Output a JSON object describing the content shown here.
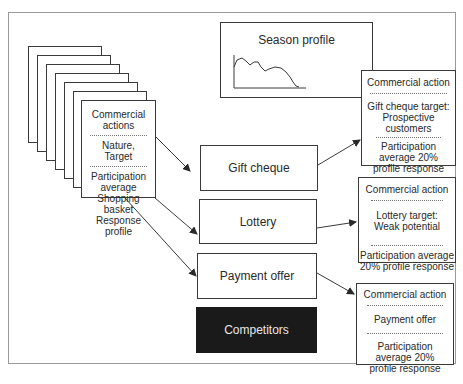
{
  "diagram": {
    "source_card": {
      "title": "Commercial actions",
      "section2": "Nature, Target",
      "section3_line1": "Participation",
      "section3_line2": "average",
      "section3_line3": "Shopping basket",
      "section3_line4": "Response profile",
      "stack_count": 7
    },
    "season_profile": {
      "title": "Season profile"
    },
    "actions": [
      {
        "label": "Gift cheque"
      },
      {
        "label": "Lottery"
      },
      {
        "label": "Payment offer"
      },
      {
        "label": "Competitors"
      }
    ],
    "result_cards": [
      {
        "header": "Commercial action",
        "target_line1": "Gift cheque target:",
        "target_line2": "Prospective",
        "target_line3": "customers",
        "footer_line1": "Participation",
        "footer_line2": "average 20%",
        "footer_line3": "profile response"
      },
      {
        "header": "Commercial action",
        "target_line1": "Lottery target:",
        "target_line2": "Weak potential",
        "footer_line1": "Participation average",
        "footer_line2": "20% profile response"
      },
      {
        "header": "Commercial action",
        "target_line1": "Payment offer",
        "footer_line1": "Participation",
        "footer_line2": "average 20%",
        "footer_line3": "profile response"
      }
    ],
    "colors": {
      "line": "#3a3a3a",
      "dark_box": "#1a1a1a",
      "dark_box_text": "#e8e8e8"
    }
  }
}
